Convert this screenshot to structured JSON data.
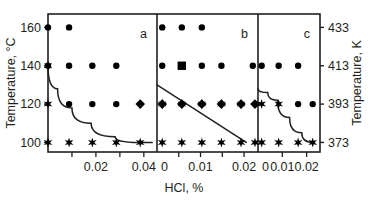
{
  "chart_data": {
    "type": "scatter",
    "title": "",
    "xlabel": "HCl, %",
    "ylabel_left": "Temperature, °C",
    "ylabel_right": "Temperature, K",
    "ylim_c": [
      95,
      167
    ],
    "yticks_c": [
      100,
      120,
      140,
      160
    ],
    "yticklabels_c": [
      "100",
      "120",
      "140",
      "160"
    ],
    "yticks_k": [
      373,
      393,
      413,
      433
    ],
    "yticklabels_k": [
      "373",
      "393",
      "413",
      "433"
    ],
    "grid": false,
    "legend": "none",
    "panels": [
      {
        "id": "a",
        "label": "a",
        "xlim": [
          0,
          0.0455
        ],
        "xticks": [
          0.01,
          0.02,
          0.03,
          0.04
        ],
        "xticklabels": [
          "",
          "0.02",
          "",
          "0.04"
        ],
        "series": [
          {
            "name": "circle-marker",
            "marker": "circle",
            "points": [
              {
                "x": 0.0,
                "y": 160
              },
              {
                "x": 0.0088,
                "y": 160
              },
              {
                "x": 0.0,
                "y": 140
              },
              {
                "x": 0.0088,
                "y": 140
              },
              {
                "x": 0.0185,
                "y": 140
              },
              {
                "x": 0.0285,
                "y": 140
              },
              {
                "x": 0.0088,
                "y": 120
              },
              {
                "x": 0.0185,
                "y": 120
              },
              {
                "x": 0.0285,
                "y": 120
              }
            ]
          },
          {
            "name": "star-marker",
            "marker": "star",
            "points": [
              {
                "x": 0.0,
                "y": 140
              },
              {
                "x": 0.0,
                "y": 120
              },
              {
                "x": 0.0,
                "y": 100
              },
              {
                "x": 0.0088,
                "y": 100
              },
              {
                "x": 0.0185,
                "y": 100
              },
              {
                "x": 0.0285,
                "y": 100
              },
              {
                "x": 0.0385,
                "y": 100
              }
            ]
          },
          {
            "name": "diamond-marker",
            "marker": "diamond",
            "points": [
              {
                "x": 0.0385,
                "y": 120
              }
            ]
          }
        ],
        "boundary_curve": [
          {
            "x": 0.0,
            "y": 140
          },
          {
            "x": 0.004,
            "y": 128
          },
          {
            "x": 0.01,
            "y": 118
          },
          {
            "x": 0.018,
            "y": 110
          },
          {
            "x": 0.028,
            "y": 103
          },
          {
            "x": 0.038,
            "y": 100
          },
          {
            "x": 0.0435,
            "y": 100
          }
        ]
      },
      {
        "id": "b",
        "label": "b",
        "xlim": [
          0,
          0.0232
        ],
        "xticks": [
          0.005,
          0.01,
          0.015,
          0.02
        ],
        "xticklabels": [
          "",
          "0.01",
          "",
          "0.02"
        ],
        "series": [
          {
            "name": "circle-marker",
            "marker": "circle",
            "points": [
              {
                "x": 0.0012,
                "y": 160
              },
              {
                "x": 0.0057,
                "y": 160
              },
              {
                "x": 0.0103,
                "y": 160
              },
              {
                "x": 0.0012,
                "y": 140
              },
              {
                "x": 0.0103,
                "y": 140
              },
              {
                "x": 0.0148,
                "y": 140
              },
              {
                "x": 0.022,
                "y": 140
              }
            ]
          },
          {
            "name": "square-marker",
            "marker": "square",
            "points": [
              {
                "x": 0.0057,
                "y": 140
              }
            ]
          },
          {
            "name": "diamond-marker",
            "marker": "diamond",
            "points": [
              {
                "x": 0.0012,
                "y": 120
              },
              {
                "x": 0.0057,
                "y": 120
              },
              {
                "x": 0.0103,
                "y": 120
              },
              {
                "x": 0.0148,
                "y": 120
              },
              {
                "x": 0.0193,
                "y": 120
              },
              {
                "x": 0.0225,
                "y": 120
              }
            ]
          },
          {
            "name": "star-marker",
            "marker": "star",
            "points": [
              {
                "x": 0.0012,
                "y": 120
              },
              {
                "x": 0.0057,
                "y": 120
              },
              {
                "x": 0.0103,
                "y": 120
              },
              {
                "x": 0.0148,
                "y": 120
              },
              {
                "x": 0.0193,
                "y": 120
              },
              {
                "x": 0.0012,
                "y": 100
              },
              {
                "x": 0.0057,
                "y": 100
              },
              {
                "x": 0.0103,
                "y": 100
              },
              {
                "x": 0.0148,
                "y": 100
              },
              {
                "x": 0.0193,
                "y": 100
              },
              {
                "x": 0.0225,
                "y": 100
              }
            ]
          }
        ],
        "boundary_curve": [
          {
            "x": 0.0,
            "y": 130
          },
          {
            "x": 0.0205,
            "y": 100
          }
        ]
      },
      {
        "id": "c",
        "label": "c",
        "xlim": [
          0,
          0.0255
        ],
        "xticks": [
          0.01,
          0.02
        ],
        "xticklabels": [
          "0.01",
          "0.02"
        ],
        "series": [
          {
            "name": "circle-marker",
            "marker": "circle",
            "points": [
              {
                "x": 0.0015,
                "y": 140
              },
              {
                "x": 0.0085,
                "y": 140
              },
              {
                "x": 0.0165,
                "y": 140
              },
              {
                "x": 0.0165,
                "y": 120
              },
              {
                "x": 0.0225,
                "y": 120
              }
            ]
          },
          {
            "name": "star-marker",
            "marker": "star",
            "points": [
              {
                "x": 0.0015,
                "y": 120
              },
              {
                "x": 0.0085,
                "y": 120
              },
              {
                "x": 0.0015,
                "y": 100
              },
              {
                "x": 0.0085,
                "y": 100
              },
              {
                "x": 0.0165,
                "y": 100
              },
              {
                "x": 0.0225,
                "y": 100
              }
            ]
          }
        ],
        "boundary_curve": [
          {
            "x": 0.0,
            "y": 128
          },
          {
            "x": 0.004,
            "y": 126
          },
          {
            "x": 0.008,
            "y": 122
          },
          {
            "x": 0.013,
            "y": 113
          },
          {
            "x": 0.018,
            "y": 105
          },
          {
            "x": 0.0225,
            "y": 100
          }
        ]
      }
    ],
    "colors": {
      "axis": "#231f20",
      "marker": "#000000",
      "curve": "#231f20",
      "background": "#ffffff"
    }
  }
}
